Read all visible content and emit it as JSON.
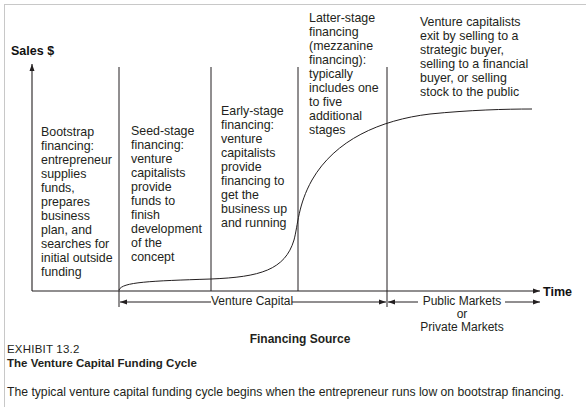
{
  "diagram": {
    "title": "The Venture Capital Funding Cycle",
    "y_axis_label": "Sales $",
    "x_axis_label": "Time",
    "stages": [
      {
        "id": "bootstrap",
        "lines": [
          "Bootstrap",
          "financing:",
          "entrepreneur",
          "supplies",
          "funds,",
          "prepares",
          "business",
          "plan, and",
          "searches for",
          "initial outside",
          "funding"
        ]
      },
      {
        "id": "seed",
        "lines": [
          "Seed-stage",
          "financing:",
          "venture",
          "capitalists",
          "provide",
          "funds to",
          "finish",
          "development",
          "of the",
          "concept"
        ]
      },
      {
        "id": "early",
        "lines": [
          "Early-stage",
          "financing:",
          "venture",
          "capitalists",
          "provide",
          "financing to",
          "get the",
          "business up",
          "and running"
        ]
      },
      {
        "id": "latter",
        "lines": [
          "Latter-stage",
          "financing",
          "(mezzanine",
          "financing):",
          "typically",
          "includes one",
          "to five",
          "additional",
          "stages"
        ]
      },
      {
        "id": "exit",
        "lines": [
          "Venture capitalists",
          "exit by selling to a",
          "strategic buyer,",
          "selling to a financial",
          "buyer, or selling",
          "stock to the public"
        ]
      }
    ],
    "financing_sources": {
      "venture_capital": "Venture Capital",
      "public_markets": "Public Markets",
      "or": "or",
      "private_markets": "Private Markets",
      "heading": "Financing Source"
    },
    "curve": "S-shaped sales curve: flat through bootstrap/seed stages, steep rise during early stage, leveling off through latter stage and exit"
  },
  "caption": {
    "exhibit": "EXHIBIT 13.2",
    "title": "The Venture Capital Funding Cycle",
    "text": "The typical venture capital funding cycle begins when the entrepreneur runs low on bootstrap financing."
  }
}
